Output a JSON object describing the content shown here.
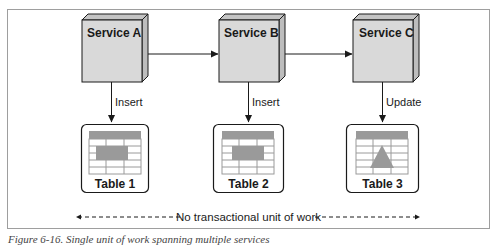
{
  "diagram": {
    "services": [
      {
        "id": "service-a",
        "label": "Service A"
      },
      {
        "id": "service-b",
        "label": "Service B"
      },
      {
        "id": "service-c",
        "label": "Service C"
      }
    ],
    "tables": [
      {
        "id": "table-1",
        "label": "Table 1",
        "icon": "table-rectangle-highlight-icon"
      },
      {
        "id": "table-2",
        "label": "Table 2",
        "icon": "table-rectangle-highlight-icon"
      },
      {
        "id": "table-3",
        "label": "Table 3",
        "icon": "table-triangle-highlight-icon"
      }
    ],
    "edges": [
      {
        "from": "service-a",
        "to": "service-b",
        "label": ""
      },
      {
        "from": "service-b",
        "to": "service-c",
        "label": ""
      },
      {
        "from": "service-a",
        "to": "table-1",
        "label": "Insert"
      },
      {
        "from": "service-b",
        "to": "table-2",
        "label": "Insert"
      },
      {
        "from": "service-c",
        "to": "table-3",
        "label": "Update"
      }
    ],
    "span_label": "No transactional unit of work",
    "colors": {
      "box_fill": "#d9d9d9",
      "box_side": "#c4c4c4",
      "stroke": "#1a1a1a",
      "table_header": "#9a9a9a",
      "frame": "#9e9e9e"
    }
  },
  "caption": "Figure 6-16. Single unit of work spanning multiple services"
}
